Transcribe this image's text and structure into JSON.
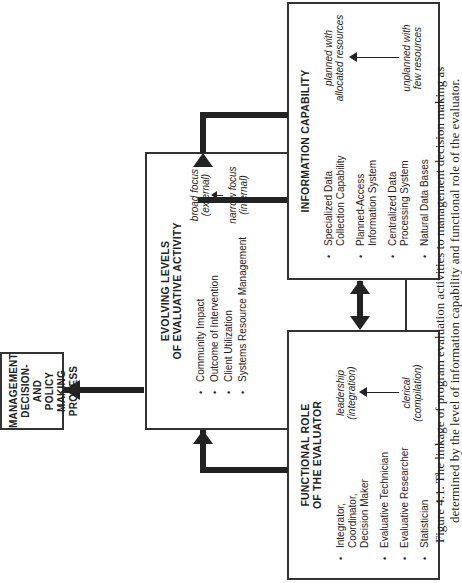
{
  "management_box": {
    "lines": [
      "MANAGEMENT",
      "DECISION- AND",
      "POLICY MAKING",
      "PROCESS"
    ]
  },
  "evolving_box": {
    "title_lines": [
      "EVOLVING LEVELS",
      "OF EVALUATIVE ACTIVITY"
    ],
    "items": [
      "Community Impact",
      "Outcome of Intervention",
      "Client Utilization",
      "Systems Resource Management"
    ],
    "scale_top": [
      "broad focus",
      "(external)"
    ],
    "scale_bottom": [
      "narrow focus",
      "(internal)"
    ]
  },
  "information_box": {
    "title": "INFORMATION CAPABILITY",
    "items": [
      [
        "Specialized Data",
        "Collection Capability"
      ],
      [
        "Planned-Access",
        "Information System"
      ],
      [
        "Centralized Data",
        "Processing System"
      ],
      [
        "Natural Data Bases"
      ]
    ],
    "scale_top": [
      "planned with",
      "allocated resources"
    ],
    "scale_bottom": [
      "unplanned with",
      "few resources"
    ]
  },
  "functional_box": {
    "title_lines": [
      "FUNCTIONAL ROLE",
      "OF THE EVALUATOR"
    ],
    "items": [
      [
        "Integrator,",
        "Coordinator,",
        "Decision Maker"
      ],
      [
        "Evaluative Technician"
      ],
      [
        "Evaluative Researcher"
      ],
      [
        "Statistician"
      ]
    ],
    "scale_top": [
      "leadership",
      "(integration)"
    ],
    "scale_bottom": [
      "clerical",
      "(compilation)"
    ]
  },
  "caption": {
    "line1": "Figure 4.1. The linkage of program evaluation activities to management decision making as",
    "line2": "determined by the level of information capability and functional role of the evaluator."
  }
}
